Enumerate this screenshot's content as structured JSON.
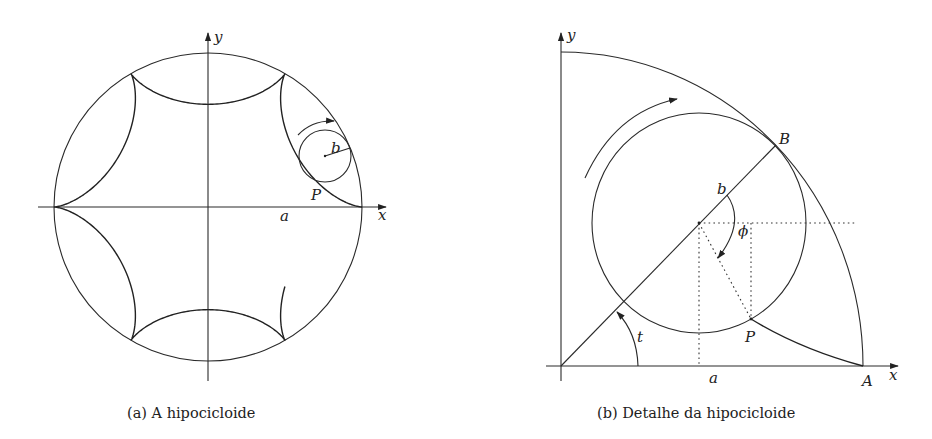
{
  "figure_a": {
    "caption": "(a) A hipocicloide",
    "labels": {
      "y_axis": "y",
      "x_axis": "x",
      "a": "a",
      "b": "b",
      "P": "P"
    },
    "hypocycloid": {
      "cusps": 6,
      "center": [
        208,
        207
      ],
      "radius": 154,
      "missing_segment_deg": [
        -60,
        0
      ],
      "partial_segment_deg": [
        -60,
        -37
      ]
    },
    "rolling_circle": {
      "center": [
        325,
        156
      ],
      "radius": 26
    }
  },
  "figure_b": {
    "caption": "(b) Detalhe da hipocicloide",
    "labels": {
      "y_axis": "y",
      "x_axis": "x",
      "a": "a",
      "b": "b",
      "P": "P",
      "A": "A",
      "B": "B",
      "t": "t",
      "phi": "ϕ"
    },
    "origin": [
      561,
      366
    ],
    "fixed_arc_radius": [
      302,
      314
    ],
    "rolling_circle": {
      "center": [
        699,
        223
      ],
      "radius": [
        107,
        110
      ]
    }
  },
  "colors": {
    "ink": "#222222",
    "background": "#ffffff"
  }
}
